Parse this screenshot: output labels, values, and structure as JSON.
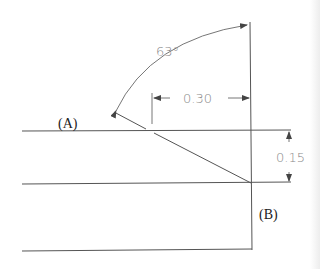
{
  "diagram": {
    "type": "technical-drawing",
    "labels": {
      "point_a": "(A)",
      "point_b": "(B)"
    },
    "dimensions": {
      "angle": "63°",
      "horizontal": "0.30",
      "vertical": "0.15"
    },
    "colors": {
      "geometry_lines": "#555555",
      "dimension_text": "#8a8a8a",
      "label_text": "#222222",
      "background": "#ffffff"
    }
  }
}
